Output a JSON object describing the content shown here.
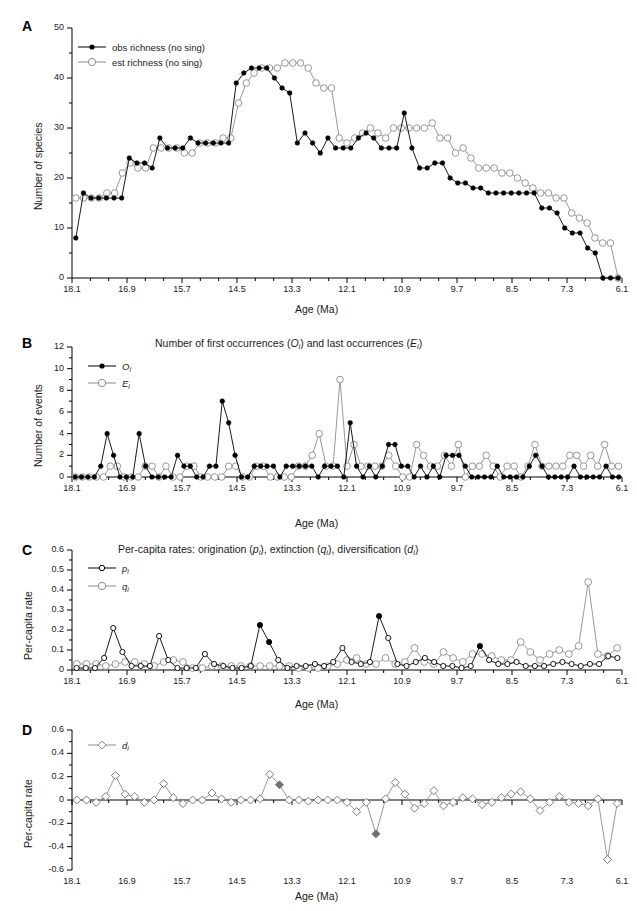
{
  "figure": {
    "width": 637,
    "height": 911,
    "colors": {
      "obs": "#000000",
      "est": "#8c8c8c",
      "axis": "#000000",
      "text": "#1a1a1a"
    },
    "x_tick_labels": [
      "18.1",
      "16.9",
      "15.7",
      "14.5",
      "13.3",
      "12.1",
      "10.9",
      "9.7",
      "8.5",
      "7.3",
      "6.1"
    ],
    "x_axis_label": "Age (Ma)",
    "x_range": [
      18.1,
      6.1
    ],
    "x_tick_step": 1.2,
    "minor_ticks_per_interval": 2
  },
  "panels": [
    {
      "letter": "A",
      "title": "",
      "ylabel": "Number of species",
      "y_ticks": [
        "0",
        "10",
        "20",
        "30",
        "40",
        "50"
      ],
      "ylim": [
        0,
        50
      ],
      "legend": [
        {
          "label": "obs richness (no sing)",
          "marker": "filled-circle",
          "color": "#000000"
        },
        {
          "label": "est richness (no sing)",
          "marker": "open-circle",
          "color": "#8c8c8c"
        }
      ]
    },
    {
      "letter": "B",
      "title": "Number of first occurrences (Oi) and last occurrences (Ei)",
      "ylabel": "Number of events",
      "y_ticks": [
        "0",
        "2",
        "4",
        "6",
        "8",
        "10",
        "12"
      ],
      "ylim": [
        0,
        12
      ],
      "legend": [
        {
          "label": "Oi",
          "marker": "filled-circle",
          "color": "#000000"
        },
        {
          "label": "Ei",
          "marker": "open-circle",
          "color": "#8c8c8c"
        }
      ]
    },
    {
      "letter": "C",
      "title": "Per-capita rates: origination (pi), extinction (qi), diversification (di)",
      "ylabel": "Per-capita rate",
      "y_ticks": [
        "0",
        "0.1",
        "0.2",
        "0.3",
        "0.4",
        "0.5",
        "0.6"
      ],
      "ylim": [
        0,
        0.6
      ],
      "legend": [
        {
          "label": "pi",
          "marker": "open-circle-small",
          "color": "#000000"
        },
        {
          "label": "qi",
          "marker": "open-circle",
          "color": "#8c8c8c"
        }
      ]
    },
    {
      "letter": "D",
      "title": "",
      "ylabel": "Per-capita rate",
      "y_ticks": [
        "-0.6",
        "-0.4",
        "-0.2",
        "0",
        "0.2",
        "0.4",
        "0.6"
      ],
      "ylim": [
        -0.6,
        0.6
      ],
      "legend": [
        {
          "label": "di",
          "marker": "open-diamond",
          "color": "#8c8c8c"
        }
      ]
    }
  ],
  "chart_data": [
    {
      "type": "line",
      "panel": "A",
      "title": "",
      "xlabel": "Age (Ma)",
      "ylabel": "Number of species",
      "xlim": [
        18.1,
        6.1
      ],
      "ylim": [
        0,
        50
      ],
      "grid": false,
      "legend_position": "top-left",
      "x": [
        18.1,
        17.9,
        17.7,
        17.5,
        17.3,
        17.1,
        16.9,
        16.7,
        16.5,
        16.3,
        16.1,
        15.9,
        15.7,
        15.5,
        15.3,
        15.1,
        14.9,
        14.7,
        14.5,
        14.3,
        14.1,
        13.9,
        13.7,
        13.5,
        13.3,
        13.1,
        12.9,
        12.7,
        12.5,
        12.3,
        12.1,
        11.9,
        11.7,
        11.5,
        11.3,
        11.1,
        10.9,
        10.7,
        10.5,
        10.3,
        10.1,
        9.9,
        9.7,
        9.5,
        9.3,
        9.1,
        8.9,
        8.7,
        8.5,
        8.3,
        8.1,
        7.9,
        7.7,
        7.5,
        7.3,
        7.1,
        6.9,
        6.7,
        6.5,
        6.3,
        6.1
      ],
      "series": [
        {
          "name": "obs richness (no sing)",
          "values": [
            8,
            17,
            16,
            16,
            16,
            16,
            16,
            24,
            23,
            23,
            22,
            28,
            26,
            26,
            26,
            28,
            27,
            27,
            27,
            27,
            27,
            39,
            41,
            42,
            42,
            42,
            40,
            38,
            37,
            27,
            29,
            27,
            25,
            28,
            26,
            26,
            26,
            28,
            29,
            28,
            26,
            26,
            26,
            33,
            26,
            22,
            22,
            23,
            23,
            20,
            19,
            19,
            18,
            18,
            17,
            17,
            17,
            17,
            17,
            17,
            17,
            14,
            14,
            13,
            10,
            9,
            9,
            6,
            5,
            0,
            0,
            0
          ]
        },
        {
          "name": "est richness (no sing)",
          "values": [
            16,
            16,
            16,
            16,
            17,
            17,
            21,
            23,
            22,
            22,
            26,
            26,
            26,
            26,
            25,
            25,
            27,
            27,
            27,
            28,
            28,
            35,
            39,
            41,
            42,
            42,
            42,
            43,
            43,
            43,
            42,
            39,
            38,
            38,
            28,
            27,
            28,
            29,
            30,
            29,
            28,
            30,
            30,
            30,
            30,
            30,
            31,
            28,
            28,
            25,
            26,
            24,
            22,
            22,
            22,
            21,
            21,
            20,
            19,
            18,
            17,
            17,
            16,
            16,
            13,
            12,
            11,
            8,
            7,
            7,
            0
          ]
        }
      ]
    },
    {
      "type": "line",
      "panel": "B",
      "title": "Number of first occurrences (Oi) and last occurrences (Ei)",
      "xlabel": "Age (Ma)",
      "ylabel": "Number of events",
      "xlim": [
        18.1,
        6.1
      ],
      "ylim": [
        0,
        12
      ],
      "grid": false,
      "legend_position": "top-left",
      "series": [
        {
          "name": "Oi",
          "values": [
            0,
            0,
            0,
            0,
            1,
            4,
            2,
            0,
            0,
            0,
            4,
            1,
            0,
            0,
            0,
            0,
            2,
            1,
            1,
            0,
            0,
            1,
            1,
            7,
            5,
            2,
            0,
            0,
            1,
            1,
            1,
            1,
            0,
            1,
            1,
            1,
            1,
            1,
            0,
            1,
            1,
            1,
            0,
            5,
            1,
            0,
            1,
            0,
            1,
            3,
            3,
            1,
            1,
            0,
            1,
            0,
            1,
            0,
            2,
            2,
            2,
            1,
            0,
            0,
            0,
            0,
            1,
            0,
            0,
            0,
            0,
            1,
            2,
            1,
            0,
            0,
            0,
            0,
            1,
            0,
            0,
            0,
            0,
            1,
            0,
            0
          ]
        },
        {
          "name": "Ei",
          "values": [
            0,
            0,
            0,
            0,
            0,
            1,
            1,
            0,
            0,
            0,
            1,
            1,
            0,
            1,
            0,
            0,
            1,
            1,
            0,
            0,
            0,
            0,
            1,
            1,
            0,
            0,
            1,
            1,
            0,
            0,
            0,
            0,
            1,
            1,
            2,
            4,
            1,
            1,
            9,
            1,
            3,
            1,
            1,
            1,
            1,
            2,
            1,
            0,
            0,
            3,
            2,
            1,
            1,
            2,
            1,
            3,
            0,
            1,
            1,
            2,
            1,
            0,
            1,
            1,
            0,
            1,
            3,
            1,
            1,
            1,
            1,
            2,
            2,
            1,
            2,
            1,
            3,
            1,
            1
          ]
        }
      ]
    },
    {
      "type": "line",
      "panel": "C",
      "title": "Per-capita rates: origination (pi), extinction (qi), diversification (di)",
      "xlabel": "Age (Ma)",
      "ylabel": "Per-capita rate",
      "xlim": [
        18.1,
        6.1
      ],
      "ylim": [
        0,
        0.6
      ],
      "grid": false,
      "legend_position": "top-left",
      "series": [
        {
          "name": "pi",
          "values": [
            0.01,
            0.01,
            0.01,
            0.06,
            0.21,
            0.09,
            0.02,
            0.02,
            0.02,
            0.17,
            0.05,
            0.01,
            0.01,
            0.01,
            0.08,
            0.03,
            0.02,
            0.01,
            0.01,
            0.02,
            0.225,
            0.14,
            0.05,
            0.01,
            0.02,
            0.02,
            0.03,
            0.02,
            0.04,
            0.11,
            0.04,
            0.03,
            0.04,
            0.27,
            0.16,
            0.03,
            0.02,
            0.04,
            0.06,
            0.04,
            0.02,
            0.02,
            0.01,
            0.02,
            0.12,
            0.05,
            0.03,
            0.03,
            0.04,
            0.02,
            0.02,
            0.02,
            0.03,
            0.04,
            0.03,
            0.02,
            0.03,
            0.03,
            0.07,
            0.06
          ]
        },
        {
          "name": "qi",
          "values": [
            0.03,
            0.03,
            0.03,
            0.02,
            0.03,
            0.04,
            0.04,
            0.03,
            0.02,
            0.04,
            0.05,
            0.04,
            0.01,
            0.01,
            0.02,
            0.02,
            0.02,
            0.02,
            0.02,
            0.02,
            0.02,
            0.02,
            0.02,
            0.01,
            0.01,
            0.01,
            0.02,
            0.03,
            0.05,
            0.06,
            0.03,
            0.03,
            0.06,
            0.03,
            0.04,
            0.11,
            0.04,
            0.03,
            0.09,
            0.06,
            0.04,
            0.08,
            0.08,
            0.07,
            0.05,
            0.05,
            0.14,
            0.09,
            0.05,
            0.08,
            0.1,
            0.08,
            0.12,
            0.44,
            0.08,
            0.07,
            0.11
          ]
        }
      ]
    },
    {
      "type": "line",
      "panel": "D",
      "title": "",
      "xlabel": "Age (Ma)",
      "ylabel": "Per-capita rate",
      "xlim": [
        18.1,
        6.1
      ],
      "ylim": [
        -0.6,
        0.6
      ],
      "grid": false,
      "legend_position": "top-left",
      "series": [
        {
          "name": "di",
          "values": [
            0,
            0,
            -0.02,
            0.03,
            0.21,
            0.05,
            0.03,
            -0.02,
            0,
            0.14,
            0.02,
            -0.03,
            0,
            0,
            0.06,
            0.01,
            -0.02,
            0,
            0,
            0.01,
            0.22,
            0.13,
            0,
            0,
            -0.01,
            0,
            0,
            0,
            -0.02,
            -0.1,
            -0.02,
            -0.29,
            0.01,
            0.15,
            0.05,
            -0.07,
            -0.03,
            0.08,
            -0.05,
            -0.02,
            0.02,
            0.01,
            -0.04,
            -0.02,
            0.02,
            0.05,
            0.07,
            0.01,
            -0.09,
            -0.02,
            0.03,
            -0.02,
            -0.03,
            -0.05,
            0.01,
            -0.51,
            -0.03
          ]
        }
      ]
    }
  ]
}
